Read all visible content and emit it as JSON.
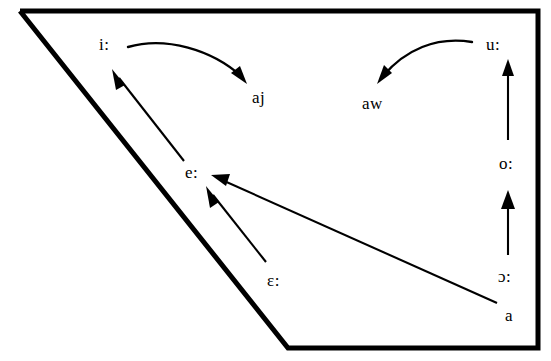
{
  "diagram": {
    "type": "vowel-trapezoid",
    "background_color": "#ffffff",
    "line_color": "#000000",
    "outline": {
      "name": "vowel-trapezoid-outline",
      "points": "20,11 538,11 538,348 288,348"
    },
    "labels": [
      {
        "id": "i-long",
        "text": "i:",
        "x": 99,
        "y": 36
      },
      {
        "id": "aj",
        "text": "aj",
        "x": 252,
        "y": 89
      },
      {
        "id": "aw",
        "text": "aw",
        "x": 362,
        "y": 95
      },
      {
        "id": "u-long",
        "text": "u:",
        "x": 486,
        "y": 36
      },
      {
        "id": "o-long",
        "text": "o:",
        "x": 499,
        "y": 155
      },
      {
        "id": "e-long",
        "text": "e:",
        "x": 185,
        "y": 164
      },
      {
        "id": "open-o-long",
        "text": "ɔ:",
        "x": 498,
        "y": 268
      },
      {
        "id": "epsilon-long",
        "text": "ɛ:",
        "x": 267,
        "y": 272
      },
      {
        "id": "a-short",
        "text": "a",
        "x": 505,
        "y": 307
      }
    ],
    "arrows": [
      {
        "id": "i-to-aj",
        "from": "i:",
        "to": "aj",
        "style": "curved"
      },
      {
        "id": "u-to-aw",
        "from": "u:",
        "to": "aw",
        "style": "curved"
      },
      {
        "id": "e-to-i",
        "from": "e:",
        "to": "i:",
        "style": "straight"
      },
      {
        "id": "epsilon-to-e",
        "from": "ɛ:",
        "to": "e:",
        "style": "straight"
      },
      {
        "id": "a-to-e",
        "from": "a",
        "to": "e:",
        "style": "straight"
      },
      {
        "id": "o-to-u",
        "from": "o:",
        "to": "u:",
        "style": "straight"
      },
      {
        "id": "open-o-to-o",
        "from": "ɔ:",
        "to": "o:",
        "style": "straight"
      }
    ]
  }
}
